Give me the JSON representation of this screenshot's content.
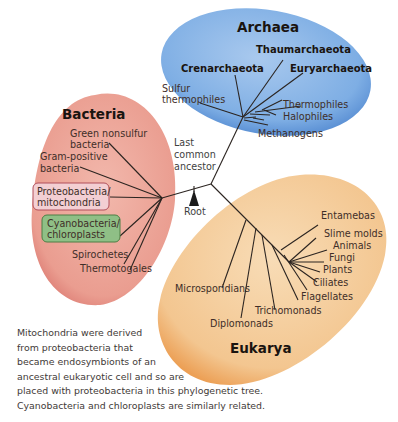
{
  "domains": {
    "archaea": {
      "title": "Archaea",
      "color": "#5b93d6",
      "groups": [
        "Thaumarchaeota",
        "Crenarchaeota",
        "Euryarchaeota"
      ],
      "labels": [
        "Sulfur",
        "thermophiles",
        "Thermophiles",
        "Halophiles",
        "Methanogens"
      ]
    },
    "bacteria": {
      "title": "Bacteria",
      "color": "#e0867a",
      "labels": [
        "Green nonsulfur",
        "bacteria",
        "Gram-positive",
        "bacteria",
        "Spirochetes",
        "Thermotogales"
      ],
      "highlight_boxes": [
        {
          "line1": "Proteobacteria/",
          "line2": "mitochondria",
          "color": "#f3cfd3"
        },
        {
          "line1": "Cyanobacteria/",
          "line2": "chloroplasts",
          "color": "#8fbf86"
        }
      ]
    },
    "eukarya": {
      "title": "Eukarya",
      "color": "#f0b26a",
      "labels": [
        "Entamebas",
        "Slime molds",
        "Animals",
        "Fungi",
        "Plants",
        "Ciliates",
        "Flagellates",
        "Trichomonads",
        "Microsporidians",
        "Diplomonads"
      ]
    }
  },
  "center": {
    "lca_lines": [
      "Last",
      "common",
      "ancestor"
    ],
    "root_label": "Root"
  },
  "caption": [
    "Mitochondria were derived",
    "from proteobacteria that",
    "became endosymbionts of an",
    "ancestral eukaryotic cell and so are",
    "placed with proteobacteria in this phylogenetic tree.",
    "Cyanobacteria and chloroplasts are similarly related."
  ]
}
